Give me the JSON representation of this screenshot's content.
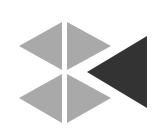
{
  "icon": {
    "name": "diamond-split-with-play-back-logo",
    "colors": {
      "background": "#ffffff",
      "light_shape": "#a9a9a9",
      "dark_shape": "#333333"
    }
  }
}
